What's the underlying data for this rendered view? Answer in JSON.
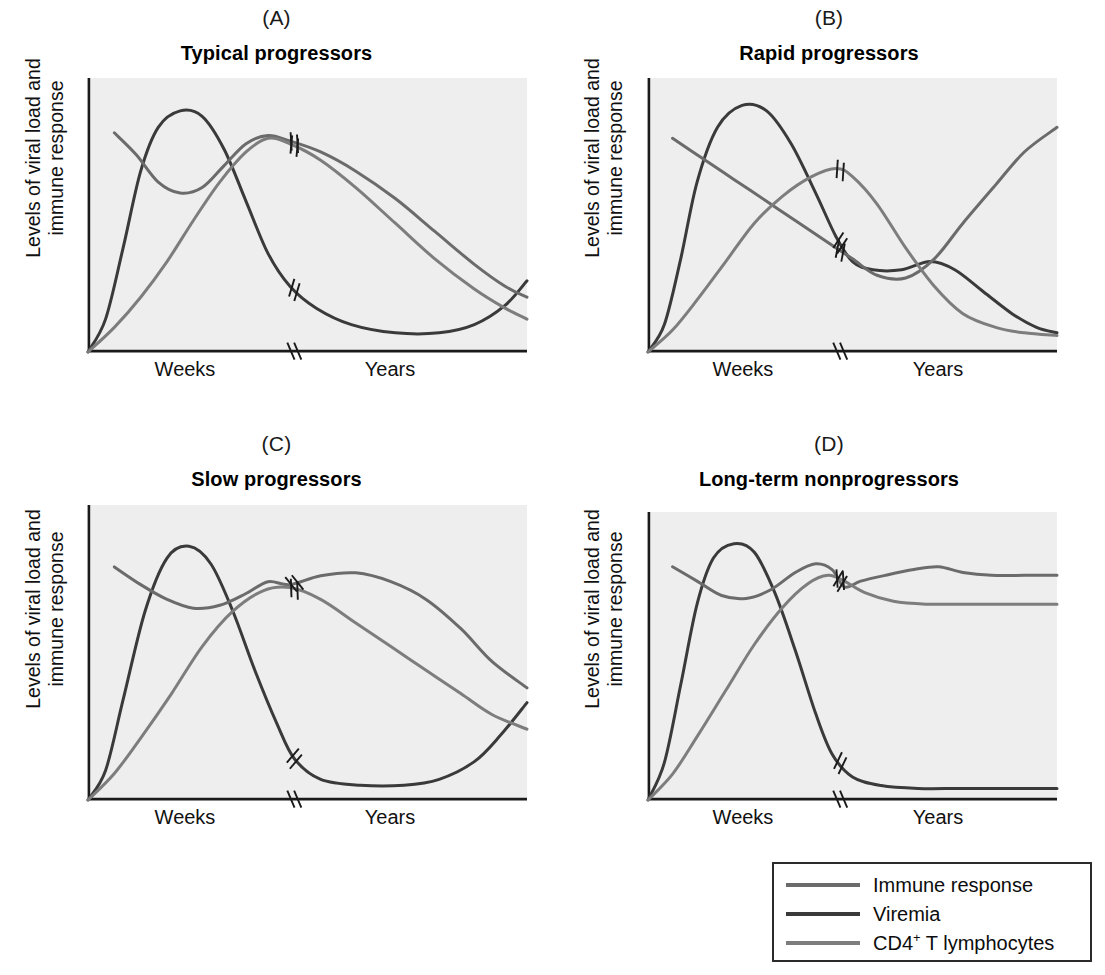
{
  "figure": {
    "axis_label_y_line1": "Levels of viral load and",
    "axis_label_y_line2": "immune response",
    "xtick_left": "Weeks",
    "xtick_right": "Years",
    "background_color": "#eeeeee",
    "axis_color": "#1a1a1a"
  },
  "panels": [
    {
      "letter": "(A)",
      "title": "Typical progressors"
    },
    {
      "letter": "(B)",
      "title": "Rapid progressors"
    },
    {
      "letter": "(C)",
      "title": "Slow progressors"
    },
    {
      "letter": "(D)",
      "title": "Long-term nonprogressors"
    }
  ],
  "legend": {
    "items": [
      {
        "label": "Immune response",
        "color": "#6b6b6b"
      },
      {
        "label": "Viremia",
        "color": "#3a3a3a"
      },
      {
        "label": "CD4",
        "label_sup": "+",
        "label_rest": " T lymphocytes",
        "color": "#7d7d7d"
      }
    ]
  },
  "chart_data": {
    "type": "line",
    "xlabel": "Time (Weeks then Years; axis broken)",
    "ylabel": "Levels of viral load and immune response",
    "xlim": [
      0,
      100
    ],
    "ylim": [
      0,
      100
    ],
    "grid": false,
    "legend_position": "bottom-right",
    "axis_break_x": 47,
    "tick_labels": {
      "left": "Weeks",
      "right": "Years"
    },
    "panels": [
      {
        "letter": "(A)",
        "title": "Typical progressors",
        "series": [
          {
            "name": "Viremia",
            "color": "#3a3a3a",
            "points": [
              [
                0,
                0
              ],
              [
                4,
                12
              ],
              [
                8,
                38
              ],
              [
                12,
                66
              ],
              [
                16,
                82
              ],
              [
                21,
                88
              ],
              [
                26,
                86
              ],
              [
                31,
                74
              ],
              [
                36,
                55
              ],
              [
                41,
                36
              ],
              [
                46,
                24
              ],
              [
                52,
                16
              ],
              [
                60,
                10
              ],
              [
                70,
                7
              ],
              [
                80,
                7
              ],
              [
                88,
                10
              ],
              [
                95,
                17
              ],
              [
                100,
                26
              ]
            ]
          },
          {
            "name": "Immune response",
            "color": "#6b6b6b",
            "points": [
              [
                6,
                80
              ],
              [
                11,
                72
              ],
              [
                16,
                62
              ],
              [
                21,
                58
              ],
              [
                26,
                60
              ],
              [
                31,
                68
              ],
              [
                36,
                76
              ],
              [
                41,
                79
              ],
              [
                46,
                77
              ],
              [
                53,
                73
              ],
              [
                61,
                66
              ],
              [
                70,
                56
              ],
              [
                79,
                44
              ],
              [
                88,
                32
              ],
              [
                95,
                24
              ],
              [
                100,
                20
              ]
            ]
          },
          {
            "name": "CD4+ T lymphocytes",
            "color": "#7d7d7d",
            "points": [
              [
                0,
                0
              ],
              [
                6,
                9
              ],
              [
                12,
                20
              ],
              [
                18,
                33
              ],
              [
                24,
                48
              ],
              [
                30,
                62
              ],
              [
                36,
                73
              ],
              [
                41,
                78
              ],
              [
                46,
                76
              ],
              [
                53,
                70
              ],
              [
                61,
                60
              ],
              [
                70,
                47
              ],
              [
                79,
                34
              ],
              [
                88,
                23
              ],
              [
                95,
                16
              ],
              [
                100,
                12
              ]
            ]
          }
        ]
      },
      {
        "letter": "(B)",
        "title": "Rapid progressors",
        "series": [
          {
            "name": "Viremia",
            "color": "#3a3a3a",
            "points": [
              [
                0,
                0
              ],
              [
                4,
                10
              ],
              [
                8,
                34
              ],
              [
                12,
                62
              ],
              [
                17,
                82
              ],
              [
                23,
                90
              ],
              [
                29,
                88
              ],
              [
                35,
                76
              ],
              [
                41,
                58
              ],
              [
                46,
                42
              ],
              [
                50,
                33
              ],
              [
                55,
                30
              ],
              [
                62,
                30
              ],
              [
                69,
                33
              ],
              [
                75,
                30
              ],
              [
                82,
                22
              ],
              [
                89,
                14
              ],
              [
                95,
                9
              ],
              [
                100,
                7
              ]
            ]
          },
          {
            "name": "Immune response",
            "color": "#6b6b6b",
            "points": [
              [
                6,
                78
              ],
              [
                13,
                71
              ],
              [
                21,
                63
              ],
              [
                29,
                55
              ],
              [
                37,
                47
              ],
              [
                44,
                40
              ],
              [
                50,
                34
              ],
              [
                56,
                28
              ],
              [
                63,
                27
              ],
              [
                70,
                34
              ],
              [
                77,
                47
              ],
              [
                85,
                61
              ],
              [
                92,
                73
              ],
              [
                100,
                82
              ]
            ]
          },
          {
            "name": "CD4+ T lymphocytes",
            "color": "#7d7d7d",
            "points": [
              [
                0,
                0
              ],
              [
                6,
                8
              ],
              [
                12,
                19
              ],
              [
                19,
                33
              ],
              [
                26,
                47
              ],
              [
                33,
                57
              ],
              [
                40,
                64
              ],
              [
                46,
                67
              ],
              [
                50,
                64
              ],
              [
                56,
                54
              ],
              [
                63,
                38
              ],
              [
                70,
                24
              ],
              [
                77,
                14
              ],
              [
                85,
                9
              ],
              [
                92,
                7
              ],
              [
                100,
                6
              ]
            ]
          }
        ]
      },
      {
        "letter": "(C)",
        "title": "Slow progressors",
        "series": [
          {
            "name": "Viremia",
            "color": "#3a3a3a",
            "points": [
              [
                0,
                0
              ],
              [
                4,
                10
              ],
              [
                8,
                34
              ],
              [
                13,
                64
              ],
              [
                18,
                82
              ],
              [
                23,
                86
              ],
              [
                28,
                80
              ],
              [
                33,
                64
              ],
              [
                38,
                44
              ],
              [
                43,
                26
              ],
              [
                47,
                14
              ],
              [
                53,
                7
              ],
              [
                62,
                5
              ],
              [
                72,
                5
              ],
              [
                80,
                7
              ],
              [
                88,
                13
              ],
              [
                94,
                22
              ],
              [
                100,
                33
              ]
            ]
          },
          {
            "name": "Immune response",
            "color": "#6b6b6b",
            "points": [
              [
                6,
                79
              ],
              [
                12,
                73
              ],
              [
                18,
                68
              ],
              [
                24,
                65
              ],
              [
                30,
                66
              ],
              [
                36,
                70
              ],
              [
                41,
                74
              ],
              [
                46,
                73
              ],
              [
                53,
                76
              ],
              [
                61,
                77
              ],
              [
                69,
                74
              ],
              [
                77,
                68
              ],
              [
                85,
                58
              ],
              [
                92,
                47
              ],
              [
                100,
                38
              ]
            ]
          },
          {
            "name": "CD4+ T lymphocytes",
            "color": "#7d7d7d",
            "points": [
              [
                0,
                0
              ],
              [
                6,
                9
              ],
              [
                12,
                21
              ],
              [
                19,
                36
              ],
              [
                26,
                52
              ],
              [
                33,
                64
              ],
              [
                40,
                71
              ],
              [
                46,
                72
              ],
              [
                53,
                68
              ],
              [
                61,
                60
              ],
              [
                69,
                52
              ],
              [
                77,
                44
              ],
              [
                85,
                36
              ],
              [
                92,
                29
              ],
              [
                100,
                24
              ]
            ]
          }
        ]
      },
      {
        "letter": "(D)",
        "title": "Long-term nonprogressors",
        "series": [
          {
            "name": "Viremia",
            "color": "#3a3a3a",
            "points": [
              [
                0,
                0
              ],
              [
                4,
                13
              ],
              [
                8,
                40
              ],
              [
                12,
                68
              ],
              [
                16,
                84
              ],
              [
                21,
                89
              ],
              [
                26,
                86
              ],
              [
                31,
                72
              ],
              [
                36,
                52
              ],
              [
                41,
                30
              ],
              [
                45,
                16
              ],
              [
                50,
                8
              ],
              [
                57,
                5
              ],
              [
                66,
                4
              ],
              [
                76,
                4
              ],
              [
                86,
                4
              ],
              [
                94,
                4
              ],
              [
                100,
                4
              ]
            ]
          },
          {
            "name": "Immune response",
            "color": "#6b6b6b",
            "points": [
              [
                6,
                81
              ],
              [
                12,
                76
              ],
              [
                18,
                71
              ],
              [
                24,
                70
              ],
              [
                30,
                73
              ],
              [
                36,
                79
              ],
              [
                41,
                82
              ],
              [
                45,
                80
              ],
              [
                48,
                74
              ],
              [
                52,
                76
              ],
              [
                58,
                78
              ],
              [
                65,
                80
              ],
              [
                71,
                81
              ],
              [
                77,
                79
              ],
              [
                84,
                78
              ],
              [
                92,
                78
              ],
              [
                100,
                78
              ]
            ]
          },
          {
            "name": "CD4+ T lymphocytes",
            "color": "#7d7d7d",
            "points": [
              [
                0,
                0
              ],
              [
                6,
                9
              ],
              [
                12,
                22
              ],
              [
                19,
                38
              ],
              [
                26,
                54
              ],
              [
                33,
                67
              ],
              [
                39,
                75
              ],
              [
                44,
                78
              ],
              [
                48,
                76
              ],
              [
                53,
                72
              ],
              [
                60,
                69
              ],
              [
                68,
                68
              ],
              [
                77,
                68
              ],
              [
                86,
                68
              ],
              [
                94,
                68
              ],
              [
                100,
                68
              ]
            ]
          }
        ]
      }
    ]
  }
}
